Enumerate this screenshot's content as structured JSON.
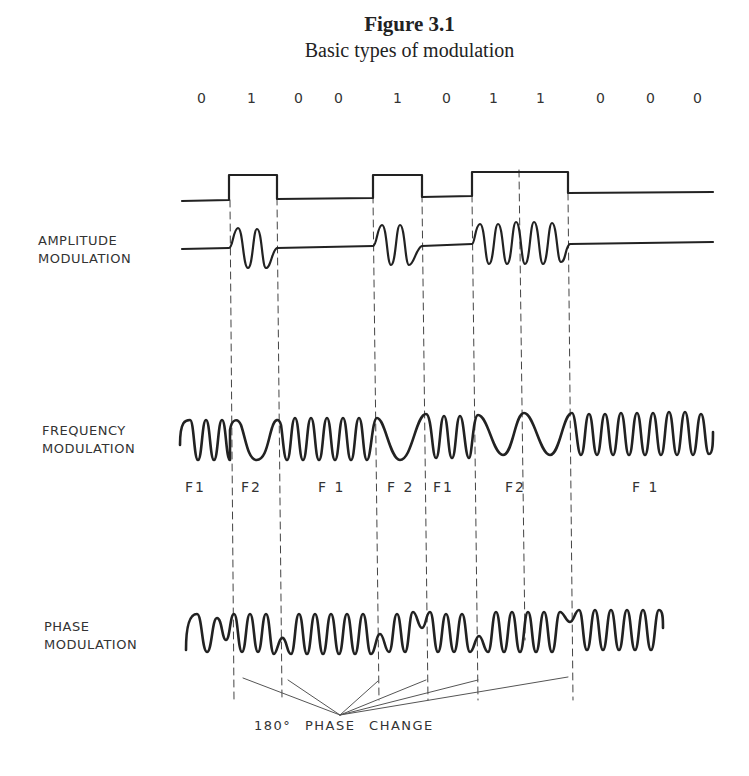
{
  "figure": {
    "number": "Figure 3.1",
    "caption": "Basic types of modulation"
  },
  "bits": [
    "0",
    "1",
    "0",
    "0",
    "1",
    "0",
    "1",
    "1",
    "0",
    "0",
    "0"
  ],
  "labels": {
    "am_line1": "AMPLITUDE",
    "am_line2": "MODULATION",
    "fm_line1": "FREQUENCY",
    "fm_line2": "MODULATION",
    "pm_line1": "PHASE",
    "pm_line2": "MODULATION"
  },
  "fm_segments": [
    "F1",
    "F2",
    "F 1",
    "F 2",
    "F1",
    "F2",
    "F 1"
  ],
  "phase_note": "180° PHASE CHANGE",
  "colors": {
    "ink": "#222222",
    "background": "#ffffff"
  }
}
